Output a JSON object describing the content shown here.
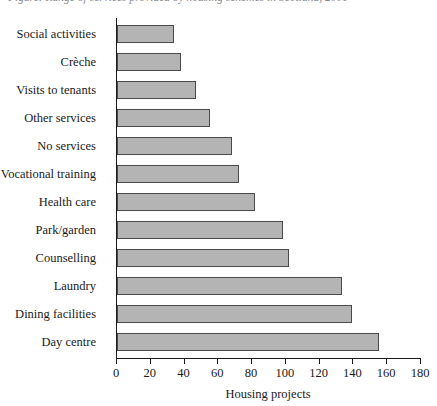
{
  "title": {
    "text": "Figure: Range of services provided by housing schemes in Scotland, 2001",
    "clipped": true
  },
  "chart_data": {
    "type": "bar",
    "orientation": "horizontal",
    "title": "",
    "xlabel": "Housing projects",
    "ylabel": "",
    "xlim": [
      0,
      180
    ],
    "xticks": [
      0,
      20,
      40,
      60,
      80,
      100,
      120,
      140,
      160,
      180
    ],
    "grid": false,
    "legend": null,
    "bar_color": "#b4b4b4",
    "bar_edge_color": "#4a4a4a",
    "categories": [
      "Social activities",
      "Crèche",
      "Visits to tenants",
      "Other services",
      "No services",
      "Vocational training",
      "Health care",
      "Park/garden",
      "Counselling",
      "Laundry",
      "Dining facilities",
      "Day centre"
    ],
    "values": [
      34,
      38,
      47,
      55,
      68,
      72,
      82,
      98,
      102,
      133,
      139,
      155
    ]
  },
  "axis": {
    "x_tick_labels": [
      "0",
      "20",
      "40",
      "60",
      "80",
      "100",
      "120",
      "140",
      "160",
      "180"
    ],
    "x_title": "Housing projects"
  }
}
